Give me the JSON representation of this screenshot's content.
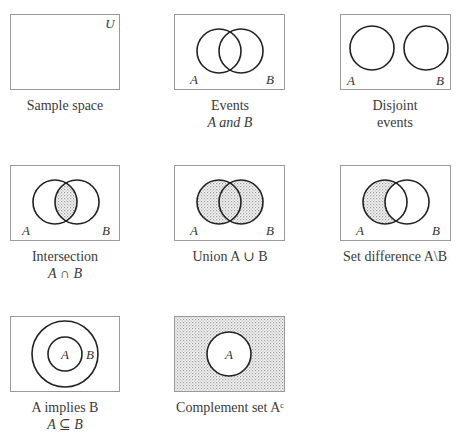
{
  "colors": {
    "frame": "#9a9a9a",
    "circle": "#222222",
    "shade": "#bdbdbd"
  },
  "panels": [
    {
      "id": "sample-space",
      "label_corner": "U",
      "caption_line1": "Sample space",
      "caption_line2": ""
    },
    {
      "id": "events",
      "label_a": "A",
      "label_b": "B",
      "caption_line1": "Events",
      "caption_line2": "A and B"
    },
    {
      "id": "disjoint",
      "label_a": "A",
      "label_b": "B",
      "caption_line1": "Disjoint",
      "caption_line2": "events"
    },
    {
      "id": "intersection",
      "label_a": "A",
      "label_b": "B",
      "caption_line1": "Intersection",
      "caption_line2": "A ∩ B"
    },
    {
      "id": "union",
      "label_a": "A",
      "label_b": "B",
      "caption_line1": "Union A ∪ B",
      "caption_line2": ""
    },
    {
      "id": "set-difference",
      "label_a": "A",
      "label_b": "B",
      "caption_line1": "Set difference A\\B",
      "caption_line2": ""
    },
    {
      "id": "implies",
      "label_a": "A",
      "label_b": "B",
      "caption_line1": "A implies B",
      "caption_line2": "A ⊆ B"
    },
    {
      "id": "complement",
      "label_a": "A",
      "caption_line1": "Complement set Aᶜ",
      "caption_line2": ""
    }
  ]
}
